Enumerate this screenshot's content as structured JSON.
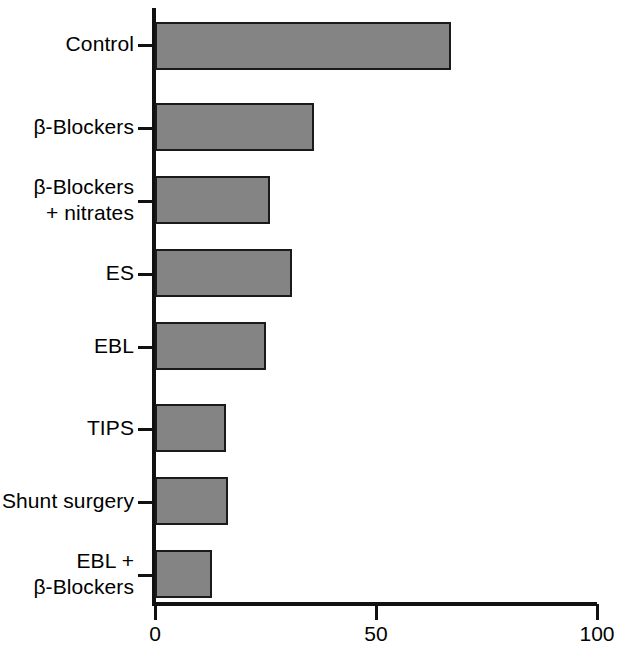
{
  "chart_data": {
    "type": "bar",
    "orientation": "horizontal",
    "title": "",
    "subtitle": "",
    "xlabel": "",
    "ylabel": "",
    "xlim": [
      0,
      100
    ],
    "xticks": [
      0,
      50,
      100
    ],
    "xtick_labels": [
      "0",
      "50",
      "100"
    ],
    "grid": false,
    "legend": null,
    "categories": [
      "Control",
      "β-Blockers",
      "β-Blockers\n+ nitrates",
      "ES",
      "EBL",
      "TIPS",
      "Shunt surgery",
      "EBL +\nβ-Blockers"
    ],
    "values": [
      67,
      36,
      26,
      31,
      25,
      16,
      16.5,
      13
    ],
    "bar_color": "#848484",
    "bar_edge_color": "#1a1a1a",
    "axis_color": "#111111",
    "background_color": "#ffffff"
  }
}
